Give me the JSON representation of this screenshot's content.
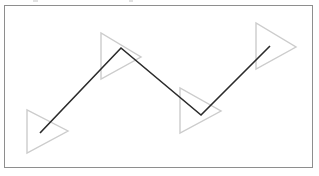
{
  "panel": {
    "title": "",
    "border_color": "#8e8e8e",
    "background_color": "#ffffff",
    "frame": {
      "x": 4,
      "y": 5,
      "width": 309,
      "height": 163
    }
  },
  "top_residue": {
    "description": "clipped-text artifact row at very top of image",
    "color": "#c9c9c9",
    "specks": [
      {
        "x": 33,
        "width": 5
      },
      {
        "x": 129,
        "width": 4
      }
    ]
  },
  "chart_data": {
    "type": "line",
    "title": "",
    "subtitle": "",
    "xlabel": "",
    "ylabel": "",
    "grid": false,
    "legend": "none",
    "xlim": [
      0,
      319
    ],
    "ylim": [
      176,
      0
    ],
    "annotations": [],
    "series": [
      {
        "name": "zigzag-polyline",
        "color": "#2b2b2b",
        "width": 1.6,
        "points": [
          {
            "x": 40,
            "y": 133
          },
          {
            "x": 121,
            "y": 48
          },
          {
            "x": 201,
            "y": 115
          },
          {
            "x": 270,
            "y": 46
          }
        ]
      }
    ],
    "markers": {
      "name": "right-pointing-triangles",
      "color": "#cccccc",
      "width": 1.4,
      "shapes": [
        {
          "id": "triangle-1",
          "orientation": "right",
          "vertices": [
            {
              "x": 27,
              "y": 110
            },
            {
              "x": 27,
              "y": 153
            },
            {
              "x": 68,
              "y": 131
            }
          ]
        },
        {
          "id": "triangle-2",
          "orientation": "right",
          "vertices": [
            {
              "x": 101,
              "y": 33
            },
            {
              "x": 101,
              "y": 79
            },
            {
              "x": 141,
              "y": 57
            }
          ]
        },
        {
          "id": "triangle-3",
          "orientation": "right",
          "vertices": [
            {
              "x": 180,
              "y": 88
            },
            {
              "x": 180,
              "y": 133
            },
            {
              "x": 221,
              "y": 111
            }
          ]
        },
        {
          "id": "triangle-4",
          "orientation": "right",
          "vertices": [
            {
              "x": 256,
              "y": 23
            },
            {
              "x": 256,
              "y": 69
            },
            {
              "x": 296,
              "y": 47
            }
          ]
        }
      ]
    }
  }
}
